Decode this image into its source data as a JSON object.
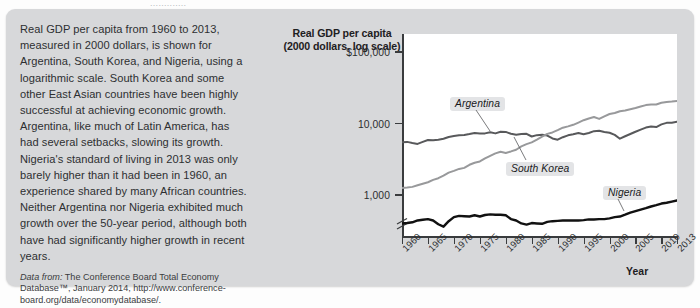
{
  "page": {
    "top_sliver_text": "............."
  },
  "caption": {
    "paragraph": "Real GDP per capita from 1960 to 2013, measured in 2000 dollars, is shown for Argentina, South Korea, and Nigeria, using a logarithmic scale. South Korea and some other East Asian countries have been highly successful at achieving economic growth. Argentina, like much of Latin America, has had several setbacks, slowing its growth. Nigeria's standard of living in 2013 was only barely higher than it had been in 1960, an experience shared by many African countries. Neither Argentina nor Nigeria exhibited much growth over the 50-year period, although both have had significantly higher growth in recent years.",
    "source_label": "Data from:",
    "source_text": " The Conference Board Total Economy Database™, January 2014, http://www.conference-board.org/data/economydatabase/."
  },
  "chart_data": {
    "type": "line",
    "title": "Real GDP per capita\n(2000 dollars, log scale)",
    "title_line1": "Real GDP per capita",
    "title_line2": "(2000 dollars, log scale)",
    "xlabel": "Year",
    "ylabel": "Real GDP per capita (2000 dollars, log scale)",
    "yscale": "log",
    "ylim": [
      250,
      180000
    ],
    "ytick_values": [
      1000,
      10000,
      100000
    ],
    "ytick_labels": [
      "1,000",
      "10,000",
      "$100,000"
    ],
    "xlim": [
      1960,
      2013
    ],
    "xtick_values": [
      1960,
      1965,
      1970,
      1975,
      1980,
      1985,
      1990,
      1995,
      2000,
      2005,
      2010,
      2013
    ],
    "xtick_labels": [
      "1960",
      "1965",
      "1970",
      "1975",
      "1980",
      "1985",
      "1990",
      "1995",
      "2000",
      "2005",
      "2010",
      "2013"
    ],
    "grid": false,
    "legend_position": "inline-callouts",
    "axis_break": true,
    "annotations": [
      {
        "text": "Argentina",
        "series": "Argentina",
        "x": 1979
      },
      {
        "text": "South Korea",
        "series": "South Korea",
        "x": 1988
      },
      {
        "text": "Nigeria",
        "series": "Nigeria",
        "x": 2002
      }
    ],
    "x": [
      1960,
      1961,
      1962,
      1963,
      1964,
      1965,
      1966,
      1967,
      1968,
      1969,
      1970,
      1971,
      1972,
      1973,
      1974,
      1975,
      1976,
      1977,
      1978,
      1979,
      1980,
      1981,
      1982,
      1983,
      1984,
      1985,
      1986,
      1987,
      1988,
      1989,
      1990,
      1991,
      1992,
      1993,
      1994,
      1995,
      1996,
      1997,
      1998,
      1999,
      2000,
      2001,
      2002,
      2003,
      2004,
      2005,
      2006,
      2007,
      2008,
      2009,
      2010,
      2011,
      2012,
      2013
    ],
    "series": [
      {
        "name": "Argentina",
        "color": "#58595b",
        "values": [
          5500,
          5550,
          5350,
          5200,
          5550,
          5900,
          5850,
          5950,
          6150,
          6500,
          6700,
          6850,
          6950,
          7150,
          7400,
          7250,
          7300,
          7550,
          7300,
          7700,
          7650,
          7200,
          7000,
          7150,
          7200,
          6600,
          6900,
          7000,
          6800,
          6200,
          5950,
          6450,
          6850,
          7100,
          7400,
          7100,
          7400,
          7850,
          7950,
          7650,
          7450,
          6950,
          6150,
          6650,
          7150,
          7700,
          8250,
          8800,
          9100,
          8950,
          9750,
          10250,
          10300,
          10600
        ]
      },
      {
        "name": "South Korea",
        "color": "#98999b",
        "values": [
          1250,
          1270,
          1300,
          1370,
          1440,
          1510,
          1630,
          1720,
          1870,
          2060,
          2180,
          2320,
          2400,
          2650,
          2830,
          2950,
          3250,
          3540,
          3830,
          4030,
          3880,
          4080,
          4310,
          4800,
          5170,
          5460,
          5960,
          6570,
          7190,
          7530,
          8090,
          8770,
          9150,
          9620,
          10350,
          11170,
          11810,
          12370,
          11650,
          12660,
          13640,
          14060,
          14930,
          15290,
          15930,
          16540,
          17330,
          18170,
          18550,
          18570,
          19600,
          20100,
          20400,
          20800
        ]
      },
      {
        "name": "Nigeria",
        "color": "#111111",
        "values": [
          400,
          405,
          415,
          440,
          450,
          460,
          440,
          390,
          360,
          430,
          490,
          510,
          505,
          500,
          520,
          500,
          525,
          535,
          530,
          530,
          520,
          460,
          440,
          400,
          385,
          405,
          400,
          395,
          420,
          430,
          435,
          440,
          440,
          440,
          440,
          445,
          455,
          455,
          460,
          460,
          470,
          490,
          500,
          530,
          565,
          595,
          625,
          655,
          690,
          720,
          760,
          780,
          810,
          840
        ]
      }
    ]
  }
}
